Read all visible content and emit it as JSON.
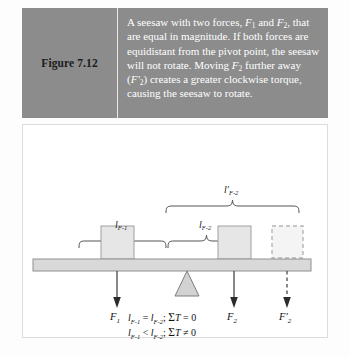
{
  "figure": {
    "label": "Figure 7.12",
    "caption_runs": [
      {
        "t": "A seesaw with two forces, ",
        "style": "normal"
      },
      {
        "t": "F",
        "style": "italic"
      },
      {
        "t": "1",
        "style": "sub"
      },
      {
        "t": " and ",
        "style": "normal"
      },
      {
        "t": "F",
        "style": "italic"
      },
      {
        "t": "2",
        "style": "sub"
      },
      {
        "t": ", that are equal in magnitude. If both forces are equidistant from the pivot point, the seesaw will not rotate. Moving ",
        "style": "normal"
      },
      {
        "t": "F",
        "style": "italic"
      },
      {
        "t": "2",
        "style": "sub"
      },
      {
        "t": " further away (",
        "style": "normal"
      },
      {
        "t": "F'",
        "style": "italic"
      },
      {
        "t": "2",
        "style": "sub"
      },
      {
        "t": ") creates a greater clockwise torque, causing the seesaw to rotate.",
        "style": "normal"
      }
    ],
    "caption_plain": "A seesaw with two forces, F1 and F2, that are equal in magnitude. If both forces are equidistant from the pivot point, the seesaw will not rotate. Moving F2 further away (F'2) creates a greater clockwise torque, causing the seesaw to rotate."
  },
  "diagram": {
    "brackets": [
      {
        "name": "lever-arm-f2-prime",
        "label_base": "l'",
        "label_sub": "F-2",
        "x": 143,
        "y": 194,
        "width": 133
      },
      {
        "name": "lever-arm-f1",
        "label_base": "l",
        "label_sub": "F-1",
        "x": 56,
        "y": 229,
        "width": 88
      },
      {
        "name": "lever-arm-f2",
        "label_base": "l",
        "label_sub": "F-2",
        "x": 144,
        "y": 229,
        "width": 78
      }
    ],
    "force_labels": [
      {
        "name": "force-label-f1",
        "base": "F",
        "sub": "1",
        "prime": false
      },
      {
        "name": "force-label-f2",
        "base": "F",
        "sub": "2",
        "prime": false
      },
      {
        "name": "force-label-f2-prime",
        "base": "F'",
        "sub": "2",
        "prime": true
      }
    ],
    "equations": [
      {
        "name": "equation-balanced",
        "plain": "l F-1 = l F-2;  ΣT = 0",
        "lhs_base": "l",
        "lhs_sub": "F-1",
        "relation": "=",
        "rhs_base": "l",
        "rhs_sub": "F-2",
        "torque": "T = 0",
        "sigma": "Σ"
      },
      {
        "name": "equation-unbalanced",
        "plain": "l F-1 < l F-2;  ΣT ≠ 0",
        "lhs_base": "l",
        "lhs_sub": "F-1",
        "relation": "<",
        "rhs_base": "l",
        "rhs_sub": "F-2",
        "torque": "T ≠ 0",
        "sigma": "Σ"
      }
    ],
    "elements": {
      "beam": "seesaw-beam",
      "fulcrum": "pivot-triangle",
      "block_left": "weight-block-f1",
      "block_right": "weight-block-f2",
      "block_moved": "weight-block-f2-prime-dashed"
    }
  },
  "colors": {
    "caption_band": "#8c8c8c",
    "caption_text": "#ffffff",
    "caption_label_text": "#1c1c1c",
    "block_fill": "#e4e4e4",
    "block_stroke": "#9a9a9a",
    "beam_fill": "#d9d9d9",
    "beam_stroke": "#8f8f8f",
    "fulcrum_fill": "#d2d2d2",
    "fulcrum_stroke": "#7d7d7d",
    "line": "#3a3a3a",
    "bracket": "#4a4a4a",
    "panel_border": "#dcdcdc"
  }
}
